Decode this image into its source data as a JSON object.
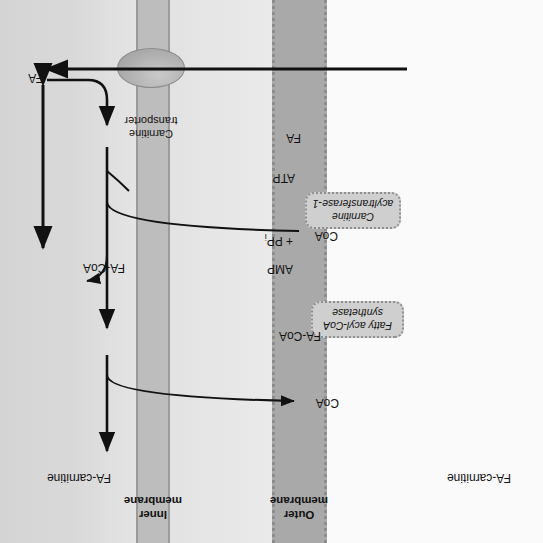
{
  "figure": {
    "orientation_note": "rotated-180"
  },
  "compartments": {
    "outer_membrane_label": "Outer\nmembrane",
    "inner_membrane_label": "Inner\nmembrane"
  },
  "enzymes": [
    {
      "name": "fatty-acyl-coa-synthetase",
      "label": "Fatty acyl-CoA\nsynthetase"
    },
    {
      "name": "carnitine-acyltransferase-1",
      "label": "Carnitine\nacyltransferase-1"
    }
  ],
  "transporter": {
    "label": "Carnitine\ntransporter"
  },
  "species": {
    "fa_cytosol": "FA",
    "fa_membrane": "FA",
    "atp": "ATP",
    "coa_1": "CoA",
    "amp_ppi_line1": "AMP",
    "amp_ppi_line2": "+ PP",
    "amp_ppi_sub": "i",
    "fa_coa_cytosol": "FA-CoA",
    "coa_2": "CoA",
    "fa_carnitine_cytosol": "FA-carnitine",
    "fa_carnitine_matrix": "FA-carnitine",
    "fa_coa_matrix": "FA-CoA"
  },
  "colors": {
    "outer_membrane_fill": "#a9a9a9",
    "outer_membrane_edge": "#8d8d8d",
    "inner_membrane_fill": "#bdbdbd",
    "inner_membrane_edge": "#9a9a9a",
    "enzyme_fill": "#cfcfcf",
    "enzyme_edge": "#8f8f8f",
    "transporter_fill": "#b0b0b0",
    "stroke": "#111111",
    "cytosol_bg": "#fafafa",
    "intermembrane_bg": "#e6e6e6",
    "matrix_bg": "#d9d9d9"
  }
}
